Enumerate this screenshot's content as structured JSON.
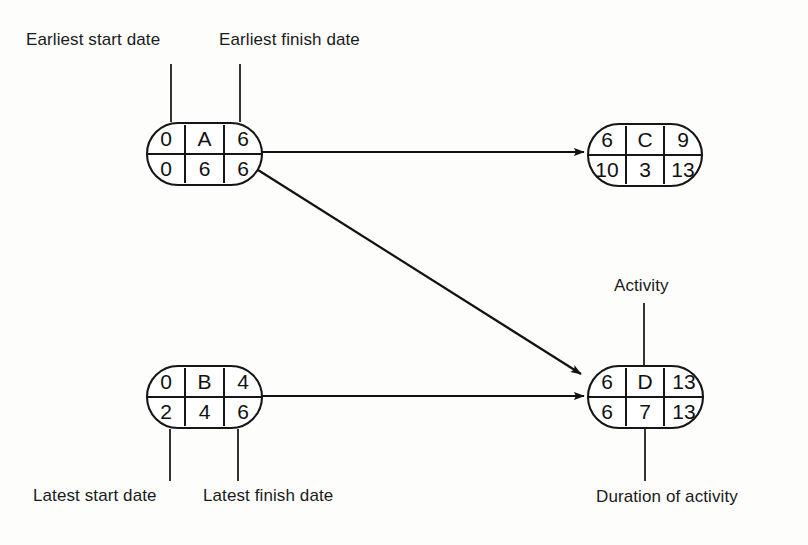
{
  "diagram": {
    "background_color": "#fdfdfc",
    "line_color": "#161616",
    "text_color": "#111111",
    "nodes": [
      {
        "id": "A",
        "activity": "A",
        "earliest_start": "0",
        "earliest_finish": "6",
        "latest_start": "0",
        "duration": "6",
        "latest_finish": "6",
        "x": 147,
        "y": 123,
        "width": 115,
        "height": 62
      },
      {
        "id": "C",
        "activity": "C",
        "earliest_start": "6",
        "earliest_finish": "9",
        "latest_start": "10",
        "duration": "3",
        "latest_finish": "13",
        "x": 588,
        "y": 124,
        "width": 114,
        "height": 62
      },
      {
        "id": "B",
        "activity": "B",
        "earliest_start": "0",
        "earliest_finish": "4",
        "latest_start": "2",
        "duration": "4",
        "latest_finish": "6",
        "x": 147,
        "y": 366,
        "width": 115,
        "height": 62
      },
      {
        "id": "D",
        "activity": "D",
        "earliest_start": "6",
        "earliest_finish": "13",
        "latest_start": "6",
        "duration": "7",
        "latest_finish": "13",
        "x": 588,
        "y": 366,
        "width": 115,
        "height": 62
      }
    ],
    "arrows": [
      {
        "name": "arrow-a-to-c",
        "from": "A",
        "to": "C"
      },
      {
        "name": "arrow-a-to-d",
        "from": "A",
        "to": "D"
      },
      {
        "name": "arrow-b-to-d",
        "from": "B",
        "to": "D"
      }
    ],
    "annotations": [
      {
        "name": "earliest-start-date",
        "text": "Earliest start date",
        "x": 26,
        "y": 30
      },
      {
        "name": "earliest-finish-date",
        "text": "Earliest finish date",
        "x": 219,
        "y": 30
      },
      {
        "name": "activity",
        "text": "Activity",
        "x": 614,
        "y": 276
      },
      {
        "name": "latest-start-date",
        "text": "Latest start date",
        "x": 33,
        "y": 486
      },
      {
        "name": "latest-finish-date",
        "text": "Latest finish date",
        "x": 203,
        "y": 486
      },
      {
        "name": "duration-of-activity",
        "text": "Duration of activity",
        "x": 596,
        "y": 487
      }
    ]
  }
}
